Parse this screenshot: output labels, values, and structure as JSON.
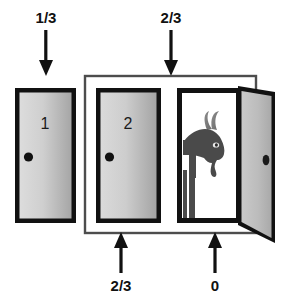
{
  "diagram": {
    "type": "probability-door-diagram",
    "background_color": "#ffffff",
    "doors": [
      {
        "id": "door-1",
        "number": "1",
        "state": "closed",
        "knob": "black-circle",
        "probability": "1/3",
        "probability_position": "top",
        "grouped": false
      },
      {
        "id": "door-2",
        "number": "2",
        "state": "closed",
        "knob": "black-circle",
        "probability": "2/3",
        "probability_position": "bottom",
        "grouped": true
      },
      {
        "id": "door-3",
        "number": "",
        "state": "open",
        "knob": "black-oval",
        "contents": "goat",
        "probability": "0",
        "probability_position": "bottom",
        "grouped": true
      }
    ],
    "group_box": {
      "label": "2/3",
      "label_position": "top",
      "contains": [
        "door-2",
        "door-3"
      ]
    },
    "labels": {
      "top_left": "1/3",
      "top_right": "2/3",
      "bottom_left": "2/3",
      "bottom_right": "0"
    },
    "arrows": [
      {
        "name": "arrow-top-left",
        "direction": "down",
        "label": "1/3"
      },
      {
        "name": "arrow-top-right",
        "direction": "down",
        "label": "2/3"
      },
      {
        "name": "arrow-bottom-left",
        "direction": "up",
        "label": "2/3"
      },
      {
        "name": "arrow-bottom-right",
        "direction": "up",
        "label": "0"
      }
    ],
    "colors": {
      "outline": "#111111",
      "door_face_light": "#d8d8d8",
      "door_face_dark": "#a8a8a8",
      "goat_body": "#4a4a4a",
      "goat_horn": "#808080",
      "group_box_stroke": "#555555",
      "arrow": "#111111",
      "doorway_interior": "#ffffff"
    }
  }
}
